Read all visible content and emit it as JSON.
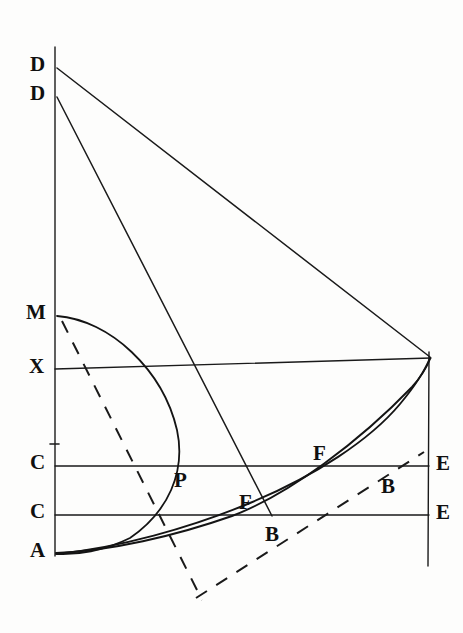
{
  "figure": {
    "background_color": "#fdfdfc",
    "ink_color": "#1a1a1a",
    "width": 463,
    "height": 633
  },
  "labels": {
    "d_upper": "D",
    "d_lower": "D",
    "m": "M",
    "x": "X",
    "c_upper": "C",
    "c_lower": "C",
    "a": "A",
    "p": "P",
    "f_upper": "F",
    "f_lower": "F",
    "b_upper": "B",
    "b_lower": "B",
    "e_upper": "E",
    "e_lower": "E"
  },
  "points": [
    {
      "name": "D-upper",
      "label": "D",
      "x": 55,
      "y": 68
    },
    {
      "name": "D-lower",
      "label": "D",
      "x": 55,
      "y": 97
    },
    {
      "name": "M",
      "label": "M",
      "x": 55,
      "y": 316
    },
    {
      "name": "X",
      "label": "X",
      "x": 55,
      "y": 370
    },
    {
      "name": "C-upper",
      "label": "C",
      "x": 55,
      "y": 466
    },
    {
      "name": "C-lower",
      "label": "C",
      "x": 55,
      "y": 515
    },
    {
      "name": "A",
      "label": "A",
      "x": 55,
      "y": 553
    },
    {
      "name": "P",
      "label": "P",
      "x": 172,
      "y": 466
    },
    {
      "name": "F-upper",
      "label": "F",
      "x": 330,
      "y": 466
    },
    {
      "name": "B-upper",
      "label": "B",
      "x": 392,
      "y": 466
    },
    {
      "name": "F-lower",
      "label": "F",
      "x": 252,
      "y": 515
    },
    {
      "name": "B-lower",
      "label": "B",
      "x": 272,
      "y": 515
    },
    {
      "name": "E-upper",
      "label": "E",
      "x": 428,
      "y": 466
    },
    {
      "name": "E-lower",
      "label": "E",
      "x": 428,
      "y": 515
    },
    {
      "name": "corner",
      "label": "",
      "x": 430,
      "y": 358
    }
  ],
  "elements": {
    "vertical_axis": "vertical line from D through M, X, C, C to A",
    "horizontal_line_x": "X to right corner",
    "horizontal_line_c_upper": "C to E",
    "horizontal_line_c_lower": "C to E",
    "right_vertical": "right edge line through E, E",
    "arc_MA": "semicircular arc from M bulging right through P to A",
    "curve_upper": "curve from A through F-upper and B-upper to corner",
    "curve_lower": "curve from A through F-lower and B-lower to corner",
    "line_D_upper": "straight line from upper D to right corner",
    "line_D_lower": "straight line from lower D to B-lower",
    "dashed_line": "dashed line from M through A region past P and B toward lower right"
  }
}
